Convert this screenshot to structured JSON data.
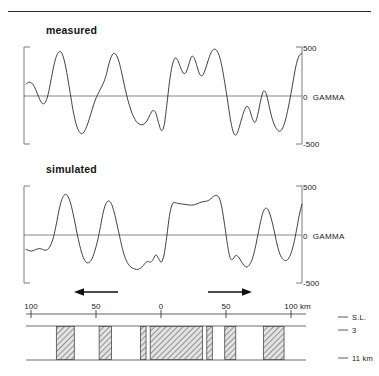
{
  "figure": {
    "panels": [
      {
        "id": "measured",
        "title": "measured"
      },
      {
        "id": "simulated",
        "title": "simulated"
      }
    ],
    "gamma_axis": {
      "top_label": "500",
      "mid_label": "0",
      "unit_label": "GAMMA",
      "bottom_label": "-500"
    },
    "distance_axis": {
      "ticks": [
        "100",
        "50",
        "0",
        "50",
        "100"
      ],
      "unit": "km"
    },
    "depth_labels": [
      {
        "text": "S.L."
      },
      {
        "text": "3"
      },
      {
        "text": "11 km"
      }
    ],
    "arrows": [
      {
        "name": "left-arrow",
        "direction": "left"
      },
      {
        "name": "right-arrow",
        "direction": "right"
      }
    ]
  },
  "chart_data": [
    {
      "type": "line",
      "name": "measured",
      "title": "measured",
      "xlabel": "km",
      "ylabel": "GAMMA",
      "xlim": [
        -100,
        100
      ],
      "ylim": [
        -600,
        620
      ],
      "ytick_labels": [
        "500",
        "0",
        "-500"
      ],
      "ytick_values": [
        500,
        0,
        -500
      ],
      "xtick_labels": [
        "100",
        "50",
        "0",
        "50",
        "100"
      ],
      "xtick_values": [
        -100,
        -50,
        0,
        50,
        100
      ],
      "grid": false,
      "legend": "none",
      "x": [
        -100,
        -98,
        -96,
        -94,
        -92,
        -90,
        -88,
        -86,
        -84,
        -82,
        -80,
        -78,
        -76,
        -74,
        -72,
        -70,
        -68,
        -66,
        -64,
        -62,
        -60,
        -58,
        -56,
        -54,
        -52,
        -50,
        -48,
        -46,
        -44,
        -42,
        -40,
        -38,
        -36,
        -34,
        -32,
        -30,
        -28,
        -26,
        -24,
        -22,
        -20,
        -18,
        -16,
        -14,
        -12,
        -10,
        -8,
        -6,
        -4,
        -2,
        0,
        2,
        4,
        6,
        8,
        10,
        12,
        14,
        16,
        18,
        20,
        22,
        24,
        26,
        28,
        30,
        32,
        34,
        36,
        38,
        40,
        42,
        44,
        46,
        48,
        50,
        52,
        54,
        56,
        58,
        60,
        62,
        64,
        66,
        68,
        70,
        72,
        74,
        76,
        78,
        80,
        82,
        84,
        86,
        88,
        90,
        92,
        94,
        96,
        98,
        100
      ],
      "y": [
        150,
        175,
        165,
        120,
        40,
        -45,
        -95,
        -80,
        20,
        190,
        370,
        500,
        560,
        540,
        430,
        250,
        40,
        -170,
        -330,
        -430,
        -470,
        -450,
        -380,
        -280,
        -165,
        -60,
        20,
        90,
        160,
        260,
        400,
        505,
        540,
        500,
        395,
        240,
        80,
        -60,
        -175,
        -260,
        -320,
        -350,
        -360,
        -345,
        -300,
        -230,
        -180,
        -210,
        -330,
        -430,
        -375,
        -120,
        180,
        390,
        480,
        450,
        360,
        290,
        300,
        400,
        500,
        475,
        370,
        270,
        260,
        340,
        450,
        545,
        590,
        580,
        510,
        370,
        170,
        -50,
        -280,
        -440,
        -490,
        -420,
        -300,
        -190,
        -130,
        -170,
        -280,
        -330,
        -230,
        -60,
        60,
        30,
        -110,
        -260,
        -360,
        -420,
        -440,
        -400,
        -300,
        -150,
        30,
        230,
        410,
        510,
        540,
        505,
        400,
        270,
        140,
        -20,
        -200,
        -380,
        -500,
        -555,
        -520,
        -400,
        -230,
        -60,
        90,
        200,
        260,
        290,
        270,
        220,
        180,
        150,
        100,
        40,
        -20,
        -60
      ],
      "notes": "Observed magnetic anomaly profile across the transect."
    },
    {
      "type": "line",
      "name": "simulated",
      "title": "simulated",
      "xlabel": "km",
      "ylabel": "GAMMA",
      "xlim": [
        -100,
        100
      ],
      "ylim": [
        -600,
        620
      ],
      "ytick_labels": [
        "500",
        "0",
        "-500"
      ],
      "ytick_values": [
        500,
        0,
        -500
      ],
      "xtick_labels": [
        "100",
        "50",
        "0",
        "50",
        "100"
      ],
      "xtick_values": [
        -100,
        -50,
        0,
        50,
        100
      ],
      "grid": false,
      "legend": "none",
      "x": [
        -100,
        -98,
        -96,
        -94,
        -92,
        -90,
        -88,
        -86,
        -84,
        -82,
        -80,
        -78,
        -76,
        -74,
        -72,
        -70,
        -68,
        -66,
        -64,
        -62,
        -60,
        -58,
        -56,
        -54,
        -52,
        -50,
        -48,
        -46,
        -44,
        -42,
        -40,
        -38,
        -36,
        -34,
        -32,
        -30,
        -28,
        -26,
        -24,
        -22,
        -20,
        -18,
        -16,
        -14,
        -12,
        -10,
        -8,
        -6,
        -4,
        -2,
        0,
        2,
        4,
        6,
        8,
        10,
        12,
        14,
        16,
        18,
        20,
        22,
        24,
        26,
        28,
        30,
        32,
        34,
        36,
        38,
        40,
        42,
        44,
        46,
        48,
        50,
        52,
        54,
        56,
        58,
        60,
        62,
        64,
        66,
        68,
        70,
        72,
        74,
        76,
        78,
        80,
        82,
        84,
        86,
        88,
        90,
        92,
        94,
        96,
        98,
        100
      ],
      "y": [
        -180,
        -195,
        -200,
        -190,
        -175,
        -170,
        -180,
        -190,
        -175,
        -120,
        -20,
        140,
        320,
        450,
        510,
        500,
        420,
        280,
        110,
        -60,
        -200,
        -300,
        -345,
        -340,
        -290,
        -190,
        -60,
        110,
        290,
        400,
        430,
        390,
        280,
        130,
        -30,
        -180,
        -290,
        -360,
        -400,
        -420,
        -430,
        -425,
        -400,
        -360,
        -330,
        -340,
        -310,
        -250,
        -290,
        -340,
        -250,
        -20,
        250,
        390,
        410,
        400,
        395,
        390,
        385,
        380,
        378,
        382,
        395,
        410,
        420,
        425,
        435,
        460,
        490,
        500,
        470,
        340,
        120,
        -120,
        -290,
        -300,
        -255,
        -275,
        -330,
        -380,
        -400,
        -370,
        -300,
        -170,
        0,
        170,
        300,
        340,
        300,
        190,
        40,
        -120,
        -240,
        -300,
        -320,
        -300,
        -230,
        -110,
        60,
        250,
        390,
        455,
        470,
        420,
        310,
        160,
        0,
        -140,
        -230,
        -250,
        -220,
        -180,
        -160,
        -170,
        -185,
        -190
      ],
      "notes": "Model-derived magnetic anomaly profile matching the measured data."
    },
    {
      "type": "bar",
      "name": "crustal-cross-section",
      "title": "Crustal magnetization model cross-section",
      "xlabel": "km",
      "ylabel": "depth",
      "xlim": [
        -100,
        100
      ],
      "depth_top_label": "S.L.",
      "depth_mid_label": "3",
      "depth_bottom_label": "11 km",
      "blocks": [
        {
          "x_start": -78,
          "x_end": -65,
          "magnetized": true
        },
        {
          "x_start": -47,
          "x_end": -38,
          "magnetized": true
        },
        {
          "x_start": -17,
          "x_end": -13,
          "magnetized": true
        },
        {
          "x_start": -10,
          "x_end": 28,
          "magnetized": true
        },
        {
          "x_start": 31,
          "x_end": 35,
          "magnetized": true
        },
        {
          "x_start": 44,
          "x_end": 52,
          "magnetized": true
        },
        {
          "x_start": 72,
          "x_end": 87,
          "magnetized": true
        }
      ]
    }
  ]
}
